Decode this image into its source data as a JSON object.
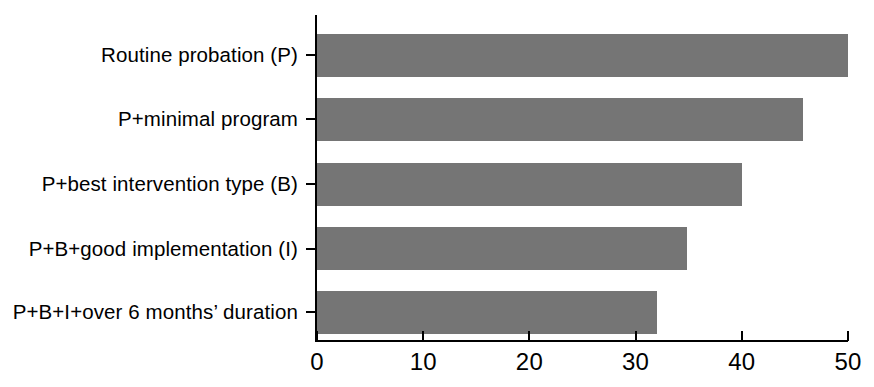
{
  "chart_data": {
    "type": "bar",
    "orientation": "horizontal",
    "title": "",
    "subtitle": "",
    "xlabel": "",
    "ylabel": "",
    "categories": [
      "Routine probation (P)",
      "P+minimal program",
      "P+best intervention type (B)",
      "P+B+good implementation (I)",
      "P+B+I+over 6 months’ duration"
    ],
    "values": [
      50,
      45.8,
      40,
      34.8,
      32
    ],
    "xlim": [
      0,
      50
    ],
    "xticks": [
      0,
      10,
      20,
      30,
      40,
      50
    ],
    "xtick_labels": [
      "0",
      "10",
      "20",
      "30",
      "40",
      "50"
    ],
    "grid": false,
    "legend": false,
    "bar_color": "#757575",
    "axis_color": "#000000",
    "background_color": "#ffffff"
  }
}
